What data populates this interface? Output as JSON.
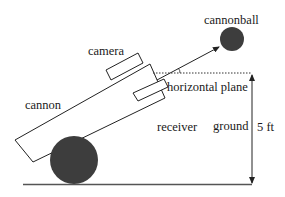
{
  "diagram": {
    "title": "",
    "labels": {
      "cannonball": "cannonball",
      "camera": "camera",
      "cannon": "cannon",
      "horizontal_plane": "horizontal plane",
      "receiver": "receiver",
      "ground": "ground",
      "height": "5 ft"
    },
    "colors": {
      "stroke": "#222222",
      "fill_dark": "#3d3d3d",
      "ground_line": "#555555",
      "background": "#ffffff"
    },
    "elements": [
      {
        "id": "cannon",
        "shape": "tilted-rectangle"
      },
      {
        "id": "wheel",
        "shape": "filled-circle"
      },
      {
        "id": "camera",
        "shape": "small-tilted-rectangle"
      },
      {
        "id": "receiver",
        "shape": "small-tilted-rectangle"
      },
      {
        "id": "trajectory-arrow",
        "shape": "arrow"
      },
      {
        "id": "cannonball",
        "shape": "filled-circle"
      },
      {
        "id": "horizontal-plane",
        "shape": "dotted-line"
      },
      {
        "id": "height-dimension",
        "shape": "double-arrow",
        "value": "5 ft"
      },
      {
        "id": "ground",
        "shape": "line"
      }
    ]
  }
}
